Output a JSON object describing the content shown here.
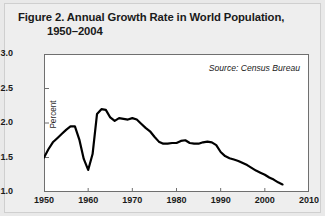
{
  "figure": {
    "title_line_1": "Figure 2. Annual Growth Rate in World Population,",
    "title_line_2": "1950–2004",
    "source_note": "Source: Census Bureau",
    "background_color": "#e9e9e9",
    "plot_background_color": "#ffffff",
    "line_color": "#000000",
    "axis_color": "#6f6f6f"
  },
  "chart_data": {
    "type": "line",
    "title": "Figure 2. Annual Growth Rate in World Population, 1950–2004",
    "xlabel": "",
    "ylabel": "Percent",
    "xlim": [
      1950,
      2010
    ],
    "ylim": [
      1.0,
      3.0
    ],
    "xticks": [
      1950,
      1960,
      1970,
      1980,
      1990,
      2000,
      2010
    ],
    "xtick_labels": [
      "1950",
      "1960",
      "1970",
      "1980",
      "1990",
      "2000",
      "2010"
    ],
    "yticks": [
      1.0,
      1.5,
      2.0,
      2.5,
      3.0
    ],
    "ytick_labels": [
      "1.0",
      "1.5",
      "2.0",
      "2.5",
      "3.0"
    ],
    "grid": false,
    "legend": false,
    "annotations": [
      {
        "text": "Source: Census Bureau",
        "position": "top-right"
      }
    ],
    "series": [
      {
        "name": "Annual growth rate of world population",
        "units": "percent",
        "x": [
          1950,
          1951,
          1952,
          1953,
          1954,
          1955,
          1956,
          1957,
          1958,
          1959,
          1960,
          1961,
          1962,
          1963,
          1964,
          1965,
          1966,
          1967,
          1968,
          1969,
          1970,
          1971,
          1972,
          1973,
          1974,
          1975,
          1976,
          1977,
          1978,
          1979,
          1980,
          1981,
          1982,
          1983,
          1984,
          1985,
          1986,
          1987,
          1988,
          1989,
          1990,
          1991,
          1992,
          1993,
          1994,
          1995,
          1996,
          1997,
          1998,
          1999,
          2000,
          2001,
          2002,
          2003,
          2004
        ],
        "values": [
          1.5,
          1.62,
          1.72,
          1.78,
          1.84,
          1.9,
          1.95,
          1.95,
          1.76,
          1.48,
          1.32,
          1.55,
          2.13,
          2.2,
          2.19,
          2.08,
          2.03,
          2.07,
          2.06,
          2.05,
          2.07,
          2.05,
          1.99,
          1.93,
          1.88,
          1.8,
          1.73,
          1.7,
          1.7,
          1.71,
          1.71,
          1.74,
          1.75,
          1.71,
          1.7,
          1.7,
          1.72,
          1.73,
          1.72,
          1.68,
          1.58,
          1.52,
          1.49,
          1.47,
          1.45,
          1.42,
          1.39,
          1.35,
          1.31,
          1.28,
          1.25,
          1.21,
          1.18,
          1.14,
          1.11
        ]
      }
    ]
  }
}
